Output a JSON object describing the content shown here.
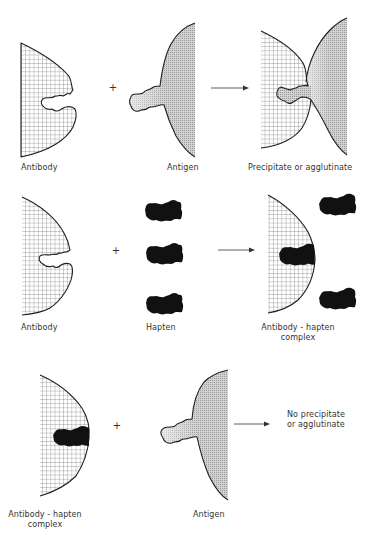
{
  "diagram": {
    "type": "antibody-antigen-hapten reaction schematic",
    "colors": {
      "outline": "#1e1e1e",
      "hatch_grid": "#555555",
      "antigen_shade": "#c8c8c8",
      "hapten": "#111111"
    },
    "rows": [
      {
        "id": "row-1",
        "reactants": [
          {
            "name": "antibody",
            "label": "Antibody"
          },
          {
            "name": "antigen",
            "label": "Antigen"
          }
        ],
        "operator": "+",
        "arrow": "→",
        "product": {
          "name": "precipitate",
          "label": "Precipitate or agglutinate"
        }
      },
      {
        "id": "row-2",
        "reactants": [
          {
            "name": "antibody",
            "label": "Antibody"
          },
          {
            "name": "hapten",
            "label": "Hapten",
            "count": 3
          }
        ],
        "operator": "+",
        "arrow": "→",
        "product": {
          "name": "antibody-hapten-complex",
          "label_line1": "Antibody - hapten",
          "label_line2": "complex",
          "free_haptens": 2
        }
      },
      {
        "id": "row-3",
        "reactants": [
          {
            "name": "antibody-hapten-complex",
            "label_line1": "Antibody - hapten",
            "label_line2": "complex"
          },
          {
            "name": "antigen",
            "label": "Antigen"
          }
        ],
        "operator": "+",
        "arrow": "→",
        "product": {
          "name": "no-reaction",
          "label_line1": "No precipitate",
          "label_line2": "or agglutinate"
        }
      }
    ]
  }
}
